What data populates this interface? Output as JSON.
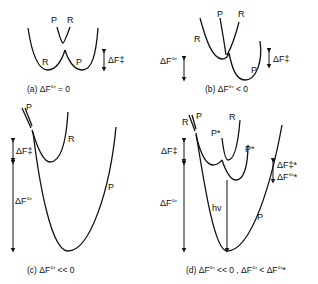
{
  "panels": {
    "a": {
      "labels": {
        "p_top": "P",
        "r_top": "R",
        "r_low": "R",
        "p_low": "P",
        "df_act": "ΔF‡"
      },
      "caption": "(a)  ΔF°′ = 0"
    },
    "b": {
      "labels": {
        "p_top": "P",
        "r_top": "R",
        "r_left": "R",
        "p_low": "P",
        "df_act": "ΔF‡",
        "df_std": "ΔF°′"
      },
      "caption": "(b)  ΔF°′ < 0"
    },
    "c": {
      "labels": {
        "p_top": "P",
        "r": "R",
        "p": "P",
        "df_act": "ΔF‡",
        "df_std": "ΔF°′"
      },
      "caption": "(c)  ΔF°′ << 0"
    },
    "d": {
      "labels": {
        "r_top": "R",
        "p_top": "P",
        "pstar_1": "P*",
        "r_right": "R",
        "pstar_2": "P*",
        "p": "P",
        "hv": "hν",
        "df_act": "ΔF‡",
        "df_std": "ΔF°′",
        "df_act_star": "ΔF‡*",
        "df_std_star": "ΔF°′*"
      },
      "caption": "(d)  ΔF°′ << 0 , ΔF°′ < ΔF°′*"
    }
  }
}
